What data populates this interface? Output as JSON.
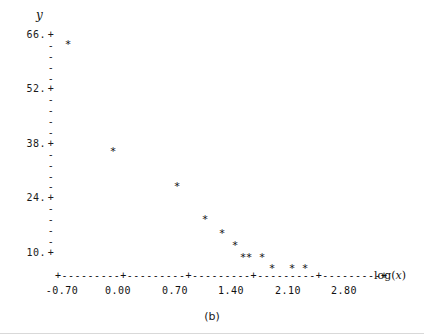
{
  "figure": {
    "caption": "(b)",
    "ylabel": "y",
    "xlabel_prefix": "log(",
    "xlabel_var": "x",
    "xlabel_suffix": ")"
  },
  "axis": {
    "y_major_labels": [
      "66.",
      "52.",
      "38.",
      "24.",
      "10."
    ],
    "y_major_glyph": "+",
    "y_minor_glyph": "-",
    "y_minor_per_gap": 4,
    "x_tick_labels": [
      "-0.70",
      "0.00",
      "0.70",
      "1.40",
      "2.10",
      "2.80"
    ],
    "x_axis_glyphs": "+---------+---------+---------+---------+---------+",
    "x_major_glyph": "+",
    "x_minor_glyph": "-",
    "x_minor_per_gap": 9
  },
  "chart_data": {
    "type": "scatter",
    "title": "(b)",
    "xlabel": "log(x)",
    "ylabel": "y",
    "marker": "*",
    "xlim": [
      -0.7,
      2.8
    ],
    "ylim": [
      10,
      66
    ],
    "xticks": [
      -0.7,
      0.0,
      0.7,
      1.4,
      2.1,
      2.8
    ],
    "yticks": [
      10,
      24,
      38,
      52,
      66
    ],
    "grid": false,
    "legend": null,
    "x": [
      -0.36,
      0.15,
      0.51,
      0.85,
      1.01,
      1.2,
      1.33,
      1.4,
      1.51,
      1.65,
      1.88,
      2.0
    ],
    "y": [
      64.5,
      38.2,
      28.8,
      23.2,
      20.0,
      17.0,
      15.4,
      15.4,
      15.5,
      13.0,
      12.8,
      12.8
    ],
    "points": [
      {
        "x": -0.36,
        "y": 64.5
      },
      {
        "x": 0.15,
        "y": 38.2
      },
      {
        "x": 0.51,
        "y": 28.8
      },
      {
        "x": 0.85,
        "y": 23.2
      },
      {
        "x": 1.01,
        "y": 20.0
      },
      {
        "x": 1.2,
        "y": 17.0
      },
      {
        "x": 1.33,
        "y": 15.4
      },
      {
        "x": 1.4,
        "y": 15.4
      },
      {
        "x": 1.51,
        "y": 15.4
      },
      {
        "x": 1.65,
        "y": 13.0
      },
      {
        "x": 1.88,
        "y": 12.8
      },
      {
        "x": 2.0,
        "y": 12.8
      }
    ]
  },
  "pixel_layout": {
    "points_px": [
      {
        "left": 68,
        "top": 44
      },
      {
        "left": 113,
        "top": 151
      },
      {
        "left": 177,
        "top": 186
      },
      {
        "left": 205,
        "top": 219
      },
      {
        "left": 222,
        "top": 233
      },
      {
        "left": 235,
        "top": 245
      },
      {
        "left": 243,
        "top": 257
      },
      {
        "left": 249,
        "top": 257
      },
      {
        "left": 262,
        "top": 257
      },
      {
        "left": 272,
        "top": 268
      },
      {
        "left": 292,
        "top": 268
      },
      {
        "left": 305,
        "top": 268
      }
    ],
    "xtick_px": [
      62,
      118,
      175,
      231,
      288,
      344
    ],
    "yrow_top": 30,
    "yrow_height": 10.9
  }
}
